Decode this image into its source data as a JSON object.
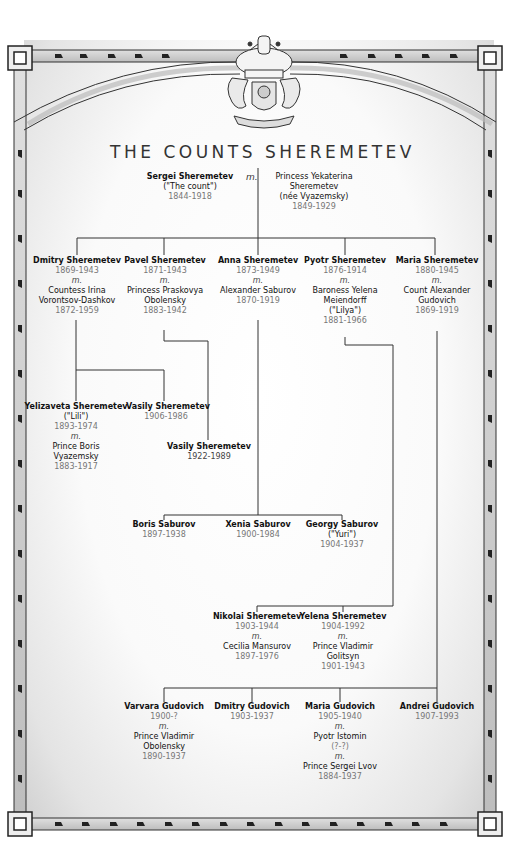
{
  "title": "THE COUNTS SHEREMETEV",
  "married_symbol": "m.",
  "crest": {
    "icon": "coat-of-arms-icon"
  },
  "colors": {
    "line": "#333333",
    "border_fill": "#cfcfcf",
    "dates": "#777777"
  },
  "root": {
    "name": "Sergei Sheremetev",
    "nickname": "(\"The count\")",
    "dates": "1844-1918",
    "spouse": [
      "Princess Yekaterina",
      "Sheremetev",
      "(née Vyazemsky)"
    ],
    "spouse_dates": "1849-1929"
  },
  "gen2": [
    {
      "name": "Dmitry Sheremetev",
      "dates": "1869-1943",
      "m": "m.",
      "spouse": [
        "Countess Irina",
        "Vorontsov-Dashkov"
      ],
      "spouse_dates": "1872-1959"
    },
    {
      "name": "Pavel Sheremetev",
      "dates": "1871-1943",
      "m": "m.",
      "spouse": [
        "Princess Praskovya",
        "Obolensky"
      ],
      "spouse_dates": "1883-1942"
    },
    {
      "name": "Anna Sheremetev",
      "dates": "1873-1949",
      "m": "m.",
      "spouse": [
        "Alexander Saburov"
      ],
      "spouse_dates": "1870-1919"
    },
    {
      "name": "Pyotr Sheremetev",
      "dates": "1876-1914",
      "m": "m.",
      "spouse": [
        "Baroness Yelena",
        "Meiendorff",
        "(\"Lilya\")"
      ],
      "spouse_dates": "1881-1966"
    },
    {
      "name": "Maria Sheremetev",
      "dates": "1880-1945",
      "m": "m.",
      "spouse": [
        "Count Alexander",
        "Gudovich"
      ],
      "spouse_dates": "1869-1919"
    }
  ],
  "dmitry_children": [
    {
      "name": "Yelizaveta Sheremetev",
      "nickname": "(\"Lili\")",
      "dates": "1893-1974",
      "m": "m.",
      "spouse": [
        "Prince Boris",
        "Vyazemsky"
      ],
      "spouse_dates": "1883-1917"
    },
    {
      "name": "Vasily Sheremetev",
      "dates": "1906-1986"
    }
  ],
  "pavel_child": {
    "name": "Vasily Sheremetev",
    "dates": "1922-1989"
  },
  "saburov_children": [
    {
      "name": "Boris Saburov",
      "dates": "1897-1938"
    },
    {
      "name": "Xenia Saburov",
      "dates": "1900-1984"
    },
    {
      "name": "Georgy Saburov",
      "nickname": "(\"Yuri\")",
      "dates": "1904-1937"
    }
  ],
  "pyotr_children": [
    {
      "name": "Nikolai Sheremetev",
      "dates": "1903-1944",
      "m": "m.",
      "spouse": [
        "Cecilia Mansurov"
      ],
      "spouse_dates": "1897-1976"
    },
    {
      "name": "Yelena Sheremetev",
      "dates": "1904-1992",
      "m": "m.",
      "spouse": [
        "Prince Vladimir",
        "Golitsyn"
      ],
      "spouse_dates": "1901-1943"
    }
  ],
  "gudovich_children": [
    {
      "name": "Varvara Gudovich",
      "dates": "1900-?",
      "m": "m.",
      "spouse": [
        "Prince Vladimir",
        "Obolensky"
      ],
      "spouse_dates": "1890-1937"
    },
    {
      "name": "Dmitry Gudovich",
      "dates": "1903-1937"
    },
    {
      "name": "Maria Gudovich",
      "dates": "1905-1940",
      "m": "m.",
      "spouse": [
        "Pyotr Istomin"
      ],
      "spouse_dates": "(?-?)",
      "m2": "m.",
      "spouse2": [
        "Prince Sergei Lvov"
      ],
      "spouse2_dates": "1884-1937"
    },
    {
      "name": "Andrei Gudovich",
      "dates": "1907-1993"
    }
  ]
}
